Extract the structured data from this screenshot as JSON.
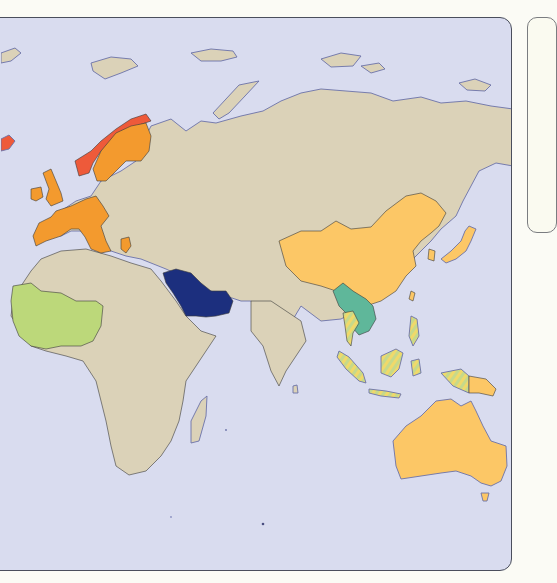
{
  "map": {
    "type": "choropleth",
    "region": "Europe, Africa, Asia and Oceania",
    "colors": {
      "ocean": "#d9dcef",
      "land_default": "#dbd2b8",
      "border": "#3b3a3a",
      "coastline": "#6b72a8"
    },
    "categories": [
      {
        "id": "red",
        "color": "#ee5a3a",
        "regions": [
          "Norway",
          "Iceland"
        ]
      },
      {
        "id": "orange",
        "color": "#f39a2e",
        "regions": [
          "Western Europe",
          "Nordic countries",
          "Southern Europe"
        ]
      },
      {
        "id": "dark-blue",
        "color": "#1c2f7e",
        "regions": [
          "Saudi Arabia",
          "Oman",
          "UAE",
          "Qatar",
          "Kuwait"
        ]
      },
      {
        "id": "light-green",
        "color": "#bcd87a",
        "regions": [
          "West Africa"
        ]
      },
      {
        "id": "light-orange",
        "color": "#fcc766",
        "regions": [
          "China",
          "Japan",
          "South Korea",
          "Australia",
          "Papua New Guinea",
          "Taiwan"
        ]
      },
      {
        "id": "teal",
        "color": "#5fb79a",
        "regions": [
          "Myanmar",
          "Laos",
          "Vietnam",
          "Cambodia"
        ]
      },
      {
        "id": "hatched-yellow-green",
        "color": "#d8d77a",
        "pattern": "diagonal-stripes",
        "regions": [
          "Thailand",
          "Malaysia",
          "Indonesia",
          "Philippines"
        ]
      }
    ]
  },
  "legend": {
    "visible": true,
    "cropped": true
  }
}
